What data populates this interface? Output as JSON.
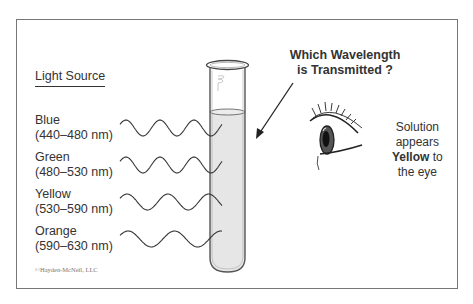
{
  "diagram": {
    "light_source_title": "Light Source",
    "sources": [
      {
        "name": "Blue",
        "range": "(440–480 nm)"
      },
      {
        "name": "Green",
        "range": "(480–530 nm)"
      },
      {
        "name": "Yellow",
        "range": "(530–590 nm)"
      },
      {
        "name": "Orange",
        "range": "(590–630 nm)"
      }
    ],
    "question_line1": "Which Wavelength",
    "question_line2": "is Transmitted ?",
    "solution_line1": "Solution",
    "solution_line2": "appears",
    "solution_color_word": "Yellow",
    "solution_line3_suffix": " to",
    "solution_line4": "the eye",
    "copyright": "©Hayden-McNeil, LLC",
    "colors": {
      "frame": "#777777",
      "solution_fill": "#e6e6e6",
      "line": "#333333"
    }
  }
}
